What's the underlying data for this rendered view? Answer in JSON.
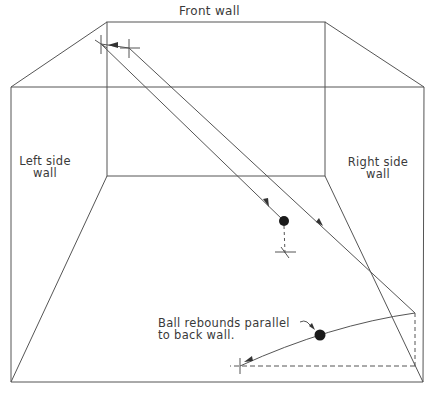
{
  "diagram": {
    "colors": {
      "line": "#555555",
      "ball": "#1a1a1a",
      "background": "#ffffff"
    },
    "labels": {
      "front_wall": "Front wall",
      "left_wall_line1": "Left side",
      "left_wall_line2": "wall",
      "right_wall_line1": "Right side",
      "right_wall_line2": "wall",
      "annotation_line1": "Ball rebounds parallel",
      "annotation_line2": "to back wall."
    },
    "geometry": {
      "front_wall": {
        "x1": 107,
        "y1": 22,
        "x2": 325,
        "y2": 176
      },
      "outer_box": {
        "x1": 11,
        "y1": 87,
        "x2": 424,
        "y2": 382
      },
      "ball1": {
        "x": 284,
        "y": 221,
        "r": 5
      },
      "ball2": {
        "x": 320,
        "y": 335,
        "r": 5.5
      },
      "front_hit_1": {
        "x": 101,
        "y": 44
      },
      "front_hit_2": {
        "x": 129,
        "y": 48
      },
      "side_rebound": {
        "x": 415,
        "y": 313
      },
      "floor_mark_1": {
        "x": 285,
        "y": 253
      },
      "floor_mark_2": {
        "x": 240,
        "y": 366
      }
    }
  }
}
